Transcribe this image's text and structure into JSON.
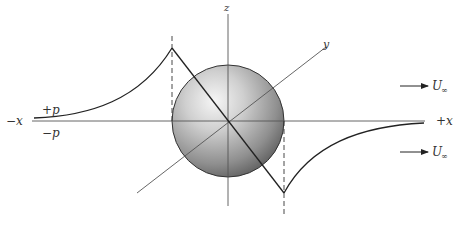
{
  "figure": {
    "axes": {
      "x_neg_label": "−x",
      "x_pos_label": "+x",
      "y_label": "y",
      "z_label": "z"
    },
    "pressure_labels": {
      "positive": "+p",
      "negative": "−p"
    },
    "freestream": {
      "label": "U",
      "subscript": "∞",
      "arrow_count": 2
    },
    "colors": {
      "line": "#222222",
      "axis": "#555555",
      "sphere_light": "#f4f4f4",
      "sphere_dark": "#5a5a5a"
    }
  }
}
